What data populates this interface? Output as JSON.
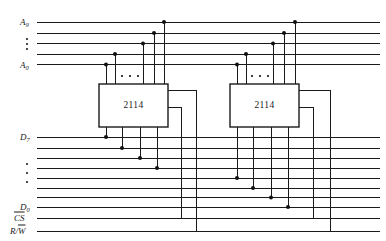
{
  "diagram": {
    "type": "logic-circuit",
    "width": 386,
    "height": 241,
    "background": "#ffffff",
    "wire_color": "#1a1a1a"
  },
  "chips": [
    {
      "id": "chip-left",
      "label": "2114",
      "x": 99,
      "y": 84,
      "width": 69,
      "height": 43,
      "address_pins": 4,
      "data_pins": 4
    },
    {
      "id": "chip-right",
      "label": "2114",
      "x": 230,
      "y": 84,
      "width": 69,
      "height": 43,
      "address_pins": 4,
      "data_pins": 4
    }
  ],
  "buses": {
    "address": {
      "top_label": "A",
      "top_index": "9",
      "bottom_label": "A",
      "bottom_index": "0",
      "line_count": 5,
      "y_positions": [
        22,
        33,
        43.5,
        54,
        64.5
      ],
      "ellipsis_rows": [
        1,
        2,
        3
      ]
    },
    "data": {
      "top_label": "D",
      "top_index": "7",
      "bottom_label": "D",
      "bottom_index": "0",
      "line_count": 8,
      "y_positions": [
        137,
        148,
        158,
        168,
        178,
        188,
        197.5,
        207
      ],
      "ellipsis_rows": [
        3,
        4,
        5
      ]
    },
    "control": [
      {
        "id": "cs",
        "label": "CS",
        "overline": true,
        "y": 218
      },
      {
        "id": "rw",
        "label": "R/W",
        "overline_part": "W",
        "y": 231
      }
    ]
  },
  "labels": {
    "address_top": "A9",
    "address_bottom": "A0",
    "data_top": "D7",
    "data_bottom": "D0",
    "chip_select": "CS",
    "read_write": "R/W",
    "chip_part_number": "2114"
  },
  "ellipsis_glyph": "• • •"
}
